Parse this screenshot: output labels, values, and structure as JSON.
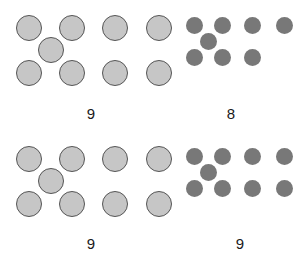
{
  "figure": {
    "background_color": "#ffffff",
    "width": 305,
    "height": 261,
    "light_dot_color": "#c6c6c6",
    "light_dot_stroke": "#555555",
    "dark_dot_color": "#787878",
    "label_color": "#1a1a1a"
  },
  "chart_data": {
    "type": "scatter",
    "xlabel": "",
    "ylabel": "",
    "grid": false,
    "legend": "none",
    "panels": [
      {
        "id": "top-left",
        "row": 1,
        "column": 1,
        "dot_style": "light",
        "dot_diameter": 26,
        "count": 9,
        "label": "9",
        "label_x": 91,
        "label_y": 106,
        "dots": [
          {
            "cx": 29,
            "cy": 28
          },
          {
            "cx": 72,
            "cy": 28
          },
          {
            "cx": 51,
            "cy": 50
          },
          {
            "cx": 29,
            "cy": 73
          },
          {
            "cx": 72,
            "cy": 73
          },
          {
            "cx": 115,
            "cy": 28
          },
          {
            "cx": 115,
            "cy": 73
          },
          {
            "cx": 159,
            "cy": 28
          },
          {
            "cx": 159,
            "cy": 73
          }
        ]
      },
      {
        "id": "top-right",
        "row": 1,
        "column": 2,
        "dot_style": "dark",
        "dot_diameter": 17,
        "count": 8,
        "label": "8",
        "label_x": 231,
        "label_y": 106,
        "dots": [
          {
            "cx": 194,
            "cy": 25
          },
          {
            "cx": 222,
            "cy": 25
          },
          {
            "cx": 208,
            "cy": 41
          },
          {
            "cx": 194,
            "cy": 57
          },
          {
            "cx": 222,
            "cy": 57
          },
          {
            "cx": 252,
            "cy": 25
          },
          {
            "cx": 252,
            "cy": 57
          },
          {
            "cx": 284,
            "cy": 25
          }
        ]
      },
      {
        "id": "bottom-left",
        "row": 2,
        "column": 1,
        "dot_style": "light",
        "dot_diameter": 26,
        "count": 9,
        "label": "9",
        "label_x": 91,
        "label_y": 236,
        "dots": [
          {
            "cx": 29,
            "cy": 159
          },
          {
            "cx": 72,
            "cy": 159
          },
          {
            "cx": 51,
            "cy": 181
          },
          {
            "cx": 29,
            "cy": 204
          },
          {
            "cx": 72,
            "cy": 204
          },
          {
            "cx": 115,
            "cy": 159
          },
          {
            "cx": 115,
            "cy": 204
          },
          {
            "cx": 159,
            "cy": 159
          },
          {
            "cx": 159,
            "cy": 204
          }
        ]
      },
      {
        "id": "bottom-right",
        "row": 2,
        "column": 2,
        "dot_style": "dark",
        "dot_diameter": 17,
        "count": 9,
        "label": "9",
        "label_x": 240,
        "label_y": 236,
        "dots": [
          {
            "cx": 194,
            "cy": 156
          },
          {
            "cx": 222,
            "cy": 156
          },
          {
            "cx": 208,
            "cy": 172
          },
          {
            "cx": 194,
            "cy": 188
          },
          {
            "cx": 222,
            "cy": 188
          },
          {
            "cx": 252,
            "cy": 156
          },
          {
            "cx": 252,
            "cy": 188
          },
          {
            "cx": 284,
            "cy": 156
          },
          {
            "cx": 284,
            "cy": 188
          }
        ]
      }
    ]
  }
}
